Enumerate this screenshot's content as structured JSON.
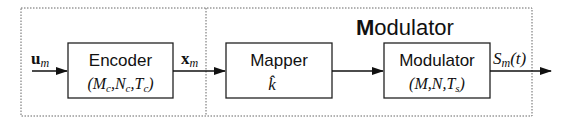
{
  "diagram": {
    "group_title_initial": "M",
    "group_title_rest": "odulator",
    "input_signal": {
      "base": "u",
      "sub": "m"
    },
    "intermediate_signal": {
      "base": "x",
      "sub": "m"
    },
    "output_signal": {
      "base": "S",
      "sub": "m",
      "suffix": "(t)"
    },
    "blocks": [
      {
        "id": "encoder",
        "label": "Encoder",
        "params": "(M_c, N_c, T_c)"
      },
      {
        "id": "mapper",
        "label": "Mapper",
        "params": "k̂"
      },
      {
        "id": "modulator",
        "label": "Modulator",
        "params": "(M, N, T_s)"
      }
    ],
    "colors": {
      "line": "#222222",
      "dotted": "#555555",
      "background": "#ffffff"
    }
  }
}
